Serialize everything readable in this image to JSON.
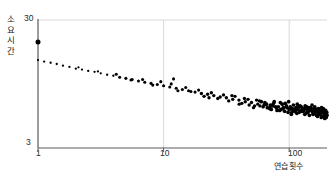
{
  "chart_data": {
    "type": "scatter",
    "title": "",
    "subtitle": "",
    "xlabel": "연습횟수",
    "ylabel": "소요시간",
    "xscale": "log",
    "yscale": "log",
    "xlim": [
      1,
      200
    ],
    "ylim": [
      3,
      30
    ],
    "xticks": [
      1,
      10,
      100
    ],
    "xticklabels": [
      "1",
      "10",
      "100"
    ],
    "yticks": [
      3,
      30
    ],
    "yticklabels": [
      "3",
      "30"
    ],
    "grid": "vertical gridlines at x=10 and x=100, faint horizontal line at y=30",
    "legend": "none",
    "marker_color": "#000000",
    "axis_color": "#5a5a5a",
    "grid_color": "#d8d8d8",
    "annotation": "Power law of practice: trial completion time decreases linearly on log-log axes as practice trials increase; first trial is an outlier above the trend.",
    "points": [
      [
        1,
        20.2
      ],
      [
        1,
        14.6
      ],
      [
        1.12,
        14.2
      ],
      [
        1.26,
        13.9
      ],
      [
        1.41,
        13.6
      ],
      [
        1.58,
        13.2
      ],
      [
        1.78,
        12.9
      ],
      [
        2.0,
        12.5
      ],
      [
        2.24,
        12.3
      ],
      [
        2.51,
        12.0
      ],
      [
        2.82,
        11.8
      ],
      [
        3.16,
        11.5
      ],
      [
        3.55,
        11.2
      ],
      [
        3.98,
        11.0
      ],
      [
        4.47,
        10.7
      ],
      [
        5.01,
        10.5
      ],
      [
        5.62,
        10.3
      ],
      [
        6.31,
        10.0
      ],
      [
        7.08,
        9.8
      ],
      [
        7.94,
        9.6
      ],
      [
        8.91,
        9.4
      ],
      [
        10.0,
        9.2
      ],
      [
        11.2,
        9.0
      ],
      [
        12.6,
        8.8
      ],
      [
        14.1,
        8.6
      ],
      [
        15.8,
        8.4
      ],
      [
        17.8,
        8.2
      ],
      [
        20.0,
        8.0
      ],
      [
        22.4,
        7.9
      ],
      [
        25.1,
        7.7
      ],
      [
        28.2,
        7.5
      ],
      [
        31.6,
        7.4
      ],
      [
        35.5,
        7.2
      ],
      [
        39.8,
        7.1
      ],
      [
        44.7,
        6.9
      ],
      [
        50.1,
        6.8
      ],
      [
        56.2,
        6.6
      ],
      [
        63.1,
        6.5
      ],
      [
        70.8,
        6.4
      ],
      [
        79.4,
        6.2
      ],
      [
        89.1,
        6.1
      ],
      [
        100,
        6.0
      ],
      [
        112,
        5.9
      ],
      [
        126,
        5.8
      ],
      [
        141,
        5.7
      ],
      [
        158,
        5.6
      ],
      [
        178,
        5.5
      ],
      [
        200,
        5.4
      ],
      [
        2.1,
        12.8
      ],
      [
        3.0,
        11.9
      ],
      [
        4.2,
        11.3
      ],
      [
        5.5,
        10.2
      ],
      [
        6.8,
        10.3
      ],
      [
        8.2,
        9.3
      ],
      [
        9.5,
        9.9
      ],
      [
        11.5,
        9.5
      ],
      [
        13.0,
        8.4
      ],
      [
        15.0,
        8.9
      ],
      [
        16.5,
        8.3
      ],
      [
        19.0,
        8.5
      ],
      [
        21.0,
        7.6
      ],
      [
        24.0,
        8.1
      ],
      [
        27.0,
        7.3
      ],
      [
        30.0,
        7.8
      ],
      [
        33.0,
        7.0
      ],
      [
        37.0,
        7.6
      ],
      [
        42.0,
        6.7
      ],
      [
        47.0,
        7.2
      ],
      [
        53.0,
        6.4
      ],
      [
        60.0,
        6.9
      ],
      [
        67.0,
        6.2
      ],
      [
        75.0,
        6.7
      ],
      [
        84.0,
        5.9
      ],
      [
        95.0,
        6.4
      ],
      [
        105,
        5.7
      ],
      [
        118,
        6.2
      ],
      [
        133,
        5.5
      ],
      [
        150,
        6.0
      ],
      [
        168,
        5.3
      ],
      [
        190,
        5.8
      ],
      [
        12.0,
        10.4
      ],
      [
        23.0,
        7.4
      ],
      [
        35.0,
        7.7
      ],
      [
        48.0,
        6.5
      ],
      [
        58.0,
        7.0
      ],
      [
        72.0,
        6.0
      ],
      [
        88.0,
        6.6
      ],
      [
        102,
        6.3
      ],
      [
        115,
        5.6
      ],
      [
        130,
        6.1
      ],
      [
        145,
        5.4
      ],
      [
        162,
        5.9
      ],
      [
        180,
        5.2
      ],
      [
        196,
        5.6
      ],
      [
        44.0,
        7.3
      ],
      [
        52.0,
        6.2
      ],
      [
        64.0,
        6.8
      ],
      [
        78.0,
        6.3
      ],
      [
        92.0,
        5.8
      ],
      [
        108,
        6.5
      ],
      [
        124,
        5.9
      ],
      [
        138,
        6.3
      ],
      [
        155,
        5.5
      ],
      [
        172,
        6.0
      ],
      [
        186,
        5.3
      ],
      [
        199,
        5.7
      ],
      [
        40.0,
        6.6
      ],
      [
        55.0,
        7.1
      ],
      [
        70.0,
        6.1
      ],
      [
        85.0,
        6.8
      ],
      [
        98.0,
        5.7
      ],
      [
        110,
        6.0
      ],
      [
        122,
        6.4
      ],
      [
        136,
        5.6
      ],
      [
        148,
        6.2
      ],
      [
        165,
        5.4
      ],
      [
        176,
        5.8
      ],
      [
        192,
        5.1
      ],
      [
        62.0,
        6.3
      ],
      [
        76.0,
        6.9
      ],
      [
        90.0,
        6.2
      ],
      [
        104,
        5.5
      ],
      [
        116,
        6.6
      ],
      [
        128,
        5.8
      ],
      [
        142,
        6.0
      ],
      [
        152,
        6.5
      ],
      [
        170,
        5.6
      ],
      [
        183,
        6.1
      ],
      [
        194,
        5.4
      ],
      [
        66.0,
        6.6
      ],
      [
        80.0,
        5.9
      ],
      [
        93.0,
        6.7
      ],
      [
        106,
        6.1
      ],
      [
        120,
        5.7
      ],
      [
        134,
        6.4
      ],
      [
        147,
        5.9
      ],
      [
        160,
        6.3
      ],
      [
        174,
        5.5
      ],
      [
        188,
        5.9
      ],
      [
        197,
        5.2
      ],
      [
        58.5,
        6.4
      ],
      [
        71.0,
        6.5
      ],
      [
        86.0,
        6.0
      ],
      [
        99.0,
        6.9
      ],
      [
        113,
        6.2
      ],
      [
        127,
        6.0
      ],
      [
        140,
        5.8
      ],
      [
        157,
        6.1
      ],
      [
        167,
        5.8
      ],
      [
        181,
        6.2
      ],
      [
        191,
        5.6
      ],
      [
        74.0,
        6.4
      ],
      [
        96.0,
        6.2
      ],
      [
        111,
        5.8
      ],
      [
        125,
        6.3
      ],
      [
        139,
        6.1
      ],
      [
        154,
        5.7
      ],
      [
        164,
        6.0
      ],
      [
        178,
        5.9
      ],
      [
        189,
        5.8
      ],
      [
        198,
        5.5
      ],
      [
        82.0,
        6.3
      ],
      [
        101,
        6.1
      ],
      [
        117,
        6.0
      ],
      [
        131,
        5.9
      ],
      [
        144,
        6.2
      ],
      [
        159,
        5.8
      ],
      [
        171,
        6.1
      ],
      [
        184,
        5.7
      ],
      [
        195,
        5.9
      ],
      [
        107,
        5.9
      ],
      [
        119,
        6.3
      ],
      [
        132,
        6.1
      ],
      [
        151,
        6.0
      ],
      [
        166,
        5.9
      ],
      [
        179,
        6.0
      ],
      [
        187,
        6.1
      ],
      [
        193,
        5.8
      ]
    ]
  }
}
